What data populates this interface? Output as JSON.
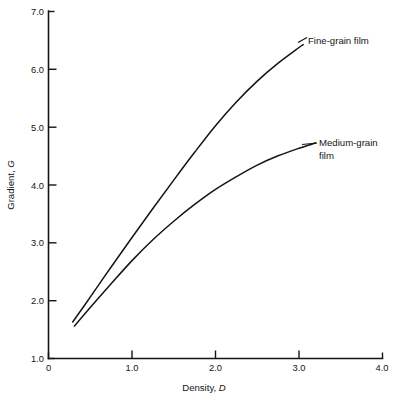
{
  "chart_data": {
    "type": "line",
    "title": "",
    "xlabel": "Density, D",
    "ylabel": "Gradient, G",
    "xlim": [
      0,
      4.0
    ],
    "ylim": [
      1.0,
      7.0
    ],
    "xticks": [
      "0",
      "1.0",
      "2.0",
      "3.0",
      "4.0"
    ],
    "yticks": [
      "1.0",
      "2.0",
      "3.0",
      "4.0",
      "5.0",
      "6.0",
      "7.0"
    ],
    "grid": false,
    "legend_position": "inline-annotations",
    "series": [
      {
        "name": "Fine-grain film",
        "label_lines": [
          "Fine-grain film"
        ],
        "x": [
          0.29,
          0.5,
          0.75,
          1.0,
          1.25,
          1.5,
          1.75,
          2.0,
          2.25,
          2.5,
          2.75,
          3.0,
          3.05
        ],
        "y": [
          1.63,
          2.06,
          2.58,
          3.09,
          3.59,
          4.08,
          4.56,
          5.02,
          5.43,
          5.79,
          6.1,
          6.37,
          6.42
        ]
      },
      {
        "name": "Medium-grain film",
        "label_lines": [
          "Medium-grain",
          "film"
        ],
        "x": [
          0.31,
          0.5,
          0.75,
          1.0,
          1.25,
          1.5,
          1.75,
          2.0,
          2.25,
          2.5,
          2.75,
          3.0,
          3.2
        ],
        "y": [
          1.56,
          1.88,
          2.29,
          2.69,
          3.05,
          3.37,
          3.66,
          3.92,
          4.14,
          4.34,
          4.5,
          4.63,
          4.72
        ]
      }
    ]
  },
  "axes": {
    "xlabel_text": "Density, ",
    "xlabel_symbol": "D",
    "ylabel_text": "Gradient, ",
    "ylabel_symbol": "G"
  },
  "annotations": {
    "fine_grain": "Fine-grain film",
    "medium_grain_line1": "Medium-grain",
    "medium_grain_line2": "film"
  }
}
